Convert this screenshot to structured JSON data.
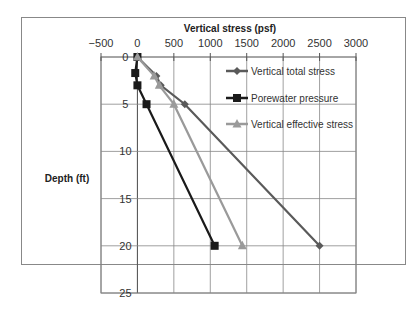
{
  "chart_data": {
    "type": "line",
    "title": "",
    "xlabel": "Vertical stress (psf)",
    "ylabel": "Depth (ft)",
    "xlim": [
      -500,
      3000
    ],
    "ylim": [
      0,
      25
    ],
    "y_inverted": true,
    "x_axis_position": "top",
    "x_ticks": [
      -500,
      0,
      500,
      1000,
      1500,
      2000,
      2500,
      3000
    ],
    "x_tick_labels": [
      "−500",
      "0",
      "500",
      "1000",
      "1500",
      "2000",
      "2500",
      "3000"
    ],
    "y_ticks": [
      0,
      5,
      10,
      15,
      20,
      25
    ],
    "y_tick_labels": [
      "0",
      "5",
      "10",
      "15",
      "20",
      "25"
    ],
    "grid": true,
    "legend_position": "right",
    "series": [
      {
        "name": "Vertical total stress",
        "color": "#5a5a5a",
        "marker": "diamond",
        "x": [
          0,
          260,
          320,
          650,
          2500
        ],
        "y": [
          0,
          2,
          3,
          5,
          20
        ]
      },
      {
        "name": "Porewater pressure",
        "color": "#1a1a1a",
        "marker": "square",
        "x": [
          0,
          -30,
          0,
          125,
          1060
        ],
        "y": [
          0,
          1.7,
          3,
          5,
          20
        ]
      },
      {
        "name": "Vertical effective stress",
        "color": "#9a9a9a",
        "marker": "triangle",
        "x": [
          0,
          230,
          300,
          500,
          1440
        ],
        "y": [
          0,
          2,
          3,
          5,
          20
        ]
      }
    ]
  }
}
